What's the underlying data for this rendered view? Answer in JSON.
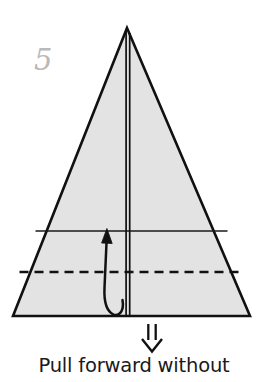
{
  "figure": {
    "kind": "origami-step-diagram",
    "step_number": "5",
    "caption": "Pull forward without",
    "background_color": "#ffffff",
    "paper_fill_color": "#e3e3e3",
    "line_color": "#111111",
    "step_number_color": "#b9b9b9",
    "caption_color": "#1a1a1a"
  },
  "shape": {
    "name": "paper-triangle",
    "apex": {
      "x": 127,
      "y": 28
    },
    "base_left": {
      "x": 13,
      "y": 316
    },
    "base_right": {
      "x": 250,
      "y": 316
    },
    "outline_width": 2.6
  },
  "creases": [
    {
      "name": "center-vertical-double-line",
      "type": "solid-double",
      "x1": 126.2,
      "x2": 129.6,
      "y_top": 30,
      "y_bottom": 316
    },
    {
      "name": "upper-horizontal-crease",
      "type": "solid",
      "y": 231,
      "x_left": 35.5,
      "x_right": 227.5
    },
    {
      "name": "lower-horizontal-fold-line",
      "type": "dashed",
      "y": 272,
      "x_left": 19.5,
      "x_right": 243.5,
      "dash": "9 6"
    }
  ],
  "arrows": [
    {
      "name": "pull-forward-curved-arrow",
      "type": "curved-loop-up",
      "tip": {
        "x": 107,
        "y": 229
      },
      "loop_bottom": {
        "x": 121,
        "y": 312
      },
      "head_style": "solid-triangle"
    },
    {
      "name": "push-down-double-arrow",
      "type": "hollow-double-line-down",
      "x_center": 152,
      "y_top": 324,
      "y_tip": 351,
      "head_style": "open-v"
    }
  ]
}
